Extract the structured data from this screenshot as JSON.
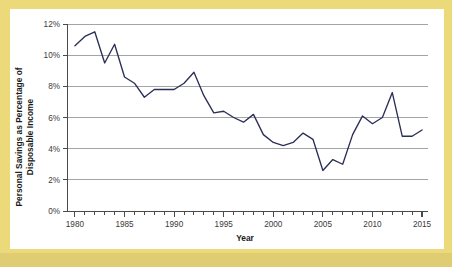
{
  "figure": {
    "border_color": "#ecd97a",
    "background_color": "#ffffff"
  },
  "chart_data": {
    "type": "line",
    "title": "",
    "xlabel": "Year",
    "ylabel": "Personal Savings as Percentage of Disposable Income",
    "ylabel_line1": "Personal Savings as Percentage of",
    "ylabel_line2": "Disposable Income",
    "xlim": [
      1979.2,
      2015.6
    ],
    "ylim": [
      0,
      12
    ],
    "grid": true,
    "grid_axis": "y",
    "legend": "none",
    "line_color": "#2b2f57",
    "y_ticks": [
      0,
      2,
      4,
      6,
      8,
      10,
      12
    ],
    "y_tick_labels": [
      "0%",
      "2%",
      "4%",
      "6%",
      "8%",
      "10%",
      "12%"
    ],
    "x_ticks": [
      1980,
      1985,
      1990,
      1995,
      2000,
      2005,
      2010,
      2015
    ],
    "x_tick_labels": [
      "1980",
      "1985",
      "1990",
      "1995",
      "2000",
      "2005",
      "2010",
      "2015"
    ],
    "x_minor_tick_step": 1,
    "x": [
      1980,
      1981,
      1982,
      1983,
      1984,
      1985,
      1986,
      1987,
      1988,
      1989,
      1990,
      1991,
      1992,
      1993,
      1994,
      1995,
      1996,
      1997,
      1998,
      1999,
      2000,
      2001,
      2002,
      2003,
      2004,
      2005,
      2006,
      2007,
      2008,
      2009,
      2010,
      2011,
      2012,
      2013,
      2014,
      2015
    ],
    "values": [
      10.6,
      11.2,
      11.5,
      9.5,
      10.7,
      8.6,
      8.2,
      7.3,
      7.8,
      7.8,
      7.8,
      8.2,
      8.9,
      7.4,
      6.3,
      6.4,
      6.0,
      5.7,
      6.2,
      4.9,
      4.4,
      4.2,
      4.4,
      5.0,
      4.6,
      2.6,
      3.3,
      3.0,
      4.9,
      6.1,
      5.6,
      6.0,
      7.6,
      4.8,
      4.8,
      5.2
    ],
    "series_name": "Personal savings rate"
  }
}
